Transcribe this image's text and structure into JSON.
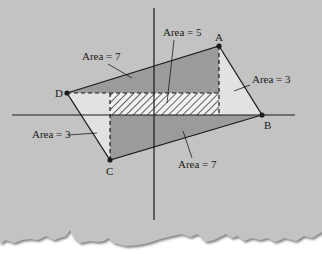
{
  "colors": {
    "paper": "#c3c3c3",
    "paper_shadow": "#8a8a8a",
    "background": "#ffffff",
    "parallelogram_dark": "#9b9b9b",
    "triangle_light": "#e2e2e2",
    "hatch_bg": "#f2f2f2",
    "hatch_line": "#222222",
    "line": "#1a1a1a"
  },
  "axes": {
    "horizontal": {
      "x1": 12,
      "y1": 115,
      "x2": 295,
      "y2": 115
    },
    "vertical": {
      "x1": 154,
      "y1": 8,
      "x2": 154,
      "y2": 220
    }
  },
  "points": [
    {
      "name": "A",
      "x": 219,
      "y": 46,
      "label_x": 215,
      "label_y": 41
    },
    {
      "name": "B",
      "x": 262,
      "y": 115,
      "label_x": 264,
      "label_y": 129
    },
    {
      "name": "C",
      "x": 110,
      "y": 160,
      "label_x": 106,
      "label_y": 175
    },
    {
      "name": "D",
      "x": 67,
      "y": 93,
      "label_x": 55,
      "label_y": 97
    }
  ],
  "hatched_rect": {
    "x": 110,
    "y": 93,
    "width": 109,
    "height": 22
  },
  "labels": [
    {
      "id": "area-upper-left",
      "text": "Area = 7",
      "x": 82,
      "y": 60,
      "leader": {
        "x1": 108,
        "y1": 64,
        "x2": 132,
        "y2": 78
      }
    },
    {
      "id": "area-top-center",
      "text": "Area = 5",
      "x": 163,
      "y": 36,
      "leader": {
        "x1": 174,
        "y1": 40,
        "x2": 167,
        "y2": 103
      }
    },
    {
      "id": "area-right",
      "text": "Area = 3",
      "x": 252,
      "y": 83,
      "leader": {
        "x1": 250,
        "y1": 85,
        "x2": 234,
        "y2": 91
      }
    },
    {
      "id": "area-left",
      "text": "Area = 3",
      "x": 32,
      "y": 138,
      "leader": {
        "x1": 68,
        "y1": 135,
        "x2": 97,
        "y2": 133
      }
    },
    {
      "id": "area-lower-right",
      "text": "Area = 7",
      "x": 178,
      "y": 168,
      "leader": {
        "x1": 192,
        "y1": 158,
        "x2": 183,
        "y2": 131
      }
    }
  ]
}
